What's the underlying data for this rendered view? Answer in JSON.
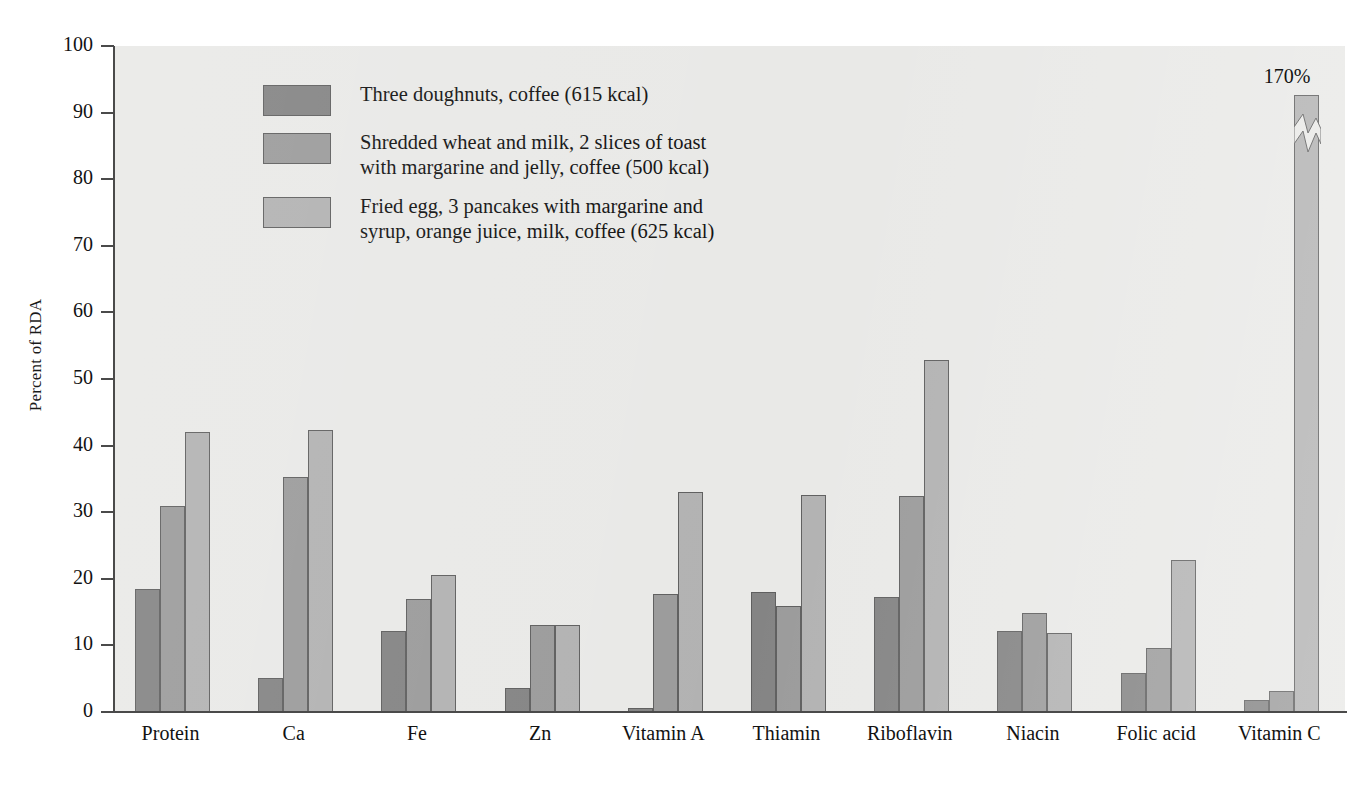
{
  "chart_data": {
    "type": "bar",
    "title": "",
    "xlabel": "",
    "ylabel": "Percent of RDA",
    "ylim": [
      0,
      100
    ],
    "yticks": [
      0,
      10,
      20,
      30,
      40,
      50,
      60,
      70,
      80,
      90,
      100
    ],
    "grid": false,
    "legend_position": "upper-left inside plot",
    "categories": [
      "Protein",
      "Ca",
      "Fe",
      "Zn",
      "Vitamin A",
      "Thiamin",
      "Riboflavin",
      "Niacin",
      "Folic acid",
      "Vitamin C"
    ],
    "series": [
      {
        "name": "Three doughnuts, coffee (615 kcal)",
        "color": "#848484",
        "values": [
          18.5,
          5.1,
          12.2,
          3.6,
          0.6,
          18.0,
          17.2,
          12.1,
          5.9,
          1.8
        ]
      },
      {
        "name": "Shredded wheat and milk, 2 slices of toast with margarine and jelly, coffee (500 kcal)",
        "color": "#9b9b9b",
        "values": [
          31.0,
          35.3,
          17.0,
          13.1,
          17.7,
          15.9,
          32.4,
          14.9,
          9.6,
          3.2
        ]
      },
      {
        "name": "Fried egg, 3 pancakes with margarine and syrup, orange juice, milk, coffee (625 kcal)",
        "color": "#b2b2b2",
        "values": [
          42.1,
          42.3,
          20.6,
          13.1,
          33.0,
          32.6,
          52.9,
          11.9,
          22.9,
          170.0
        ]
      }
    ],
    "annotations": [
      {
        "text": "170%",
        "category": "Vitamin C",
        "series": "Fried egg, 3 pancakes with margarine and syrup, orange juice, milk, coffee (625 kcal)",
        "note": "bar is truncated with an axis-break zigzag; drawn to about 93% of the scale"
      }
    ]
  },
  "legend": {
    "items": [
      {
        "swatch_name": "legend-swatch-doughnuts",
        "lines": [
          "Three doughnuts, coffee (615 kcal)"
        ]
      },
      {
        "swatch_name": "legend-swatch-shredded-wheat",
        "lines": [
          "Shredded wheat and milk, 2 slices of toast",
          "with margarine and jelly, coffee (500 kcal)"
        ]
      },
      {
        "swatch_name": "legend-swatch-fried-egg",
        "lines": [
          "Fried egg, 3 pancakes with margarine and",
          "syrup, orange juice, milk, coffee (625 kcal)"
        ]
      }
    ]
  },
  "axis": {
    "y_title": "Percent of RDA",
    "y_ticks": [
      "0",
      "10",
      "20",
      "30",
      "40",
      "50",
      "60",
      "70",
      "80",
      "90",
      "100"
    ]
  },
  "colors": {
    "series1": "#848484",
    "series2": "#9b9b9b",
    "series3": "#b2b2b2",
    "plot_background": "#e9e9e7",
    "axis": "#4a4a4a",
    "text": "#121212"
  }
}
